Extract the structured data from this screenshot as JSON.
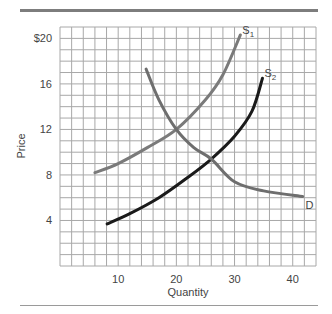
{
  "chart_data": {
    "type": "line",
    "title": "",
    "xlabel": "Quantity",
    "ylabel": "Price",
    "xlim": [
      0,
      44
    ],
    "ylim": [
      0,
      21
    ],
    "grid": true,
    "x_ticks": [
      10,
      20,
      30,
      40
    ],
    "x_tick_labels": [
      "10",
      "20",
      "30",
      "40"
    ],
    "y_ticks": [
      4,
      8,
      12,
      16,
      20
    ],
    "y_tick_labels": [
      "4",
      "8",
      "12",
      "16",
      "$20"
    ],
    "series": [
      {
        "name": "S1",
        "label_main": "S",
        "label_sub": "1",
        "color": "#7a7a7a",
        "points": [
          [
            6,
            8.2
          ],
          [
            10,
            9.0
          ],
          [
            15,
            10.4
          ],
          [
            20,
            12.0
          ],
          [
            25,
            14.6
          ],
          [
            28,
            16.8
          ],
          [
            31,
            20.3
          ]
        ]
      },
      {
        "name": "S2",
        "label_main": "S",
        "label_sub": "2",
        "color": "#1a1a1a",
        "points": [
          [
            8.1,
            3.7
          ],
          [
            12,
            4.6
          ],
          [
            17,
            6.0
          ],
          [
            22,
            7.8
          ],
          [
            26,
            9.4
          ],
          [
            30,
            11.4
          ],
          [
            33,
            13.6
          ],
          [
            34.8,
            16.5
          ]
        ]
      },
      {
        "name": "D",
        "label_main": "D",
        "label_sub": "",
        "color": "#6e6e6e",
        "points": [
          [
            14.8,
            17.3
          ],
          [
            17,
            14.6
          ],
          [
            20,
            12.0
          ],
          [
            23,
            10.4
          ],
          [
            26,
            9.4
          ],
          [
            30,
            7.4
          ],
          [
            35,
            6.6
          ],
          [
            41.7,
            6.1
          ]
        ]
      }
    ],
    "intersections": [
      {
        "between": [
          "S1",
          "D"
        ],
        "x": 20,
        "y": 12
      },
      {
        "between": [
          "S2",
          "D"
        ],
        "x": 26,
        "y": 9.4
      }
    ]
  }
}
